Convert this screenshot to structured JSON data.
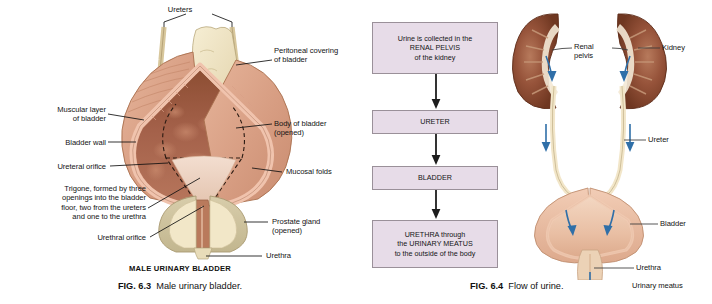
{
  "page": {
    "background": "#ffffff",
    "width": 712,
    "height": 304
  },
  "colors": {
    "flow_box_fill": "#e7dce8",
    "flow_box_border": "#9a9099",
    "arrow_blue": "#2f6fa8",
    "kidney_dark": "#7d3f28",
    "kidney_mid": "#a0583a",
    "bladder_mucosa": "#9b5a40",
    "bladder_wall_pink": "#e8b9a2",
    "peritoneum_cream": "#efe3c2",
    "prostate_tan": "#cdc19a",
    "leader_line": "#111111"
  },
  "figures": {
    "left": {
      "id": "male-urinary-bladder",
      "heading": "MALE URINARY BLADDER",
      "caption_prefix": "FIG. 6.3",
      "caption_text": "Male urinary bladder.",
      "labels": [
        {
          "key": "ureters",
          "text": "Ureters",
          "align": "center"
        },
        {
          "key": "peritoneal-covering",
          "text": "Peritoneal covering\nof bladder",
          "align": "left"
        },
        {
          "key": "muscular-layer",
          "text": "Muscular layer\nof bladder",
          "align": "right"
        },
        {
          "key": "bladder-wall",
          "text": "Bladder wall",
          "align": "right"
        },
        {
          "key": "ureteral-orifice",
          "text": "Ureteral orifice",
          "align": "right"
        },
        {
          "key": "trigone",
          "text": "Trigone, formed by three\nopenings into the bladder\nfloor, two from the ureters\nand one to the urethra",
          "align": "right"
        },
        {
          "key": "urethral-orifice",
          "text": "Urethral orifice",
          "align": "right"
        },
        {
          "key": "body-of-bladder",
          "text": "Body of bladder\n(opened)",
          "align": "left"
        },
        {
          "key": "mucosal-folds",
          "text": "Mucosal folds",
          "align": "left"
        },
        {
          "key": "prostate-gland",
          "text": "Prostate gland\n(opened)",
          "align": "left"
        },
        {
          "key": "urethra",
          "text": "Urethra",
          "align": "left"
        }
      ]
    },
    "middle": {
      "id": "flow-of-urine-flowchart",
      "steps": [
        {
          "key": "renal-pelvis",
          "text": "Urine is collected in the\nRENAL PELVIS\nof the kidney"
        },
        {
          "key": "ureter",
          "text": "URETER"
        },
        {
          "key": "bladder",
          "text": "BLADDER"
        },
        {
          "key": "urethra",
          "text": "URETHRA through\nthe URINARY MEATUS\nto the outside of the body"
        }
      ]
    },
    "right": {
      "id": "flow-of-urine-anatomy",
      "caption_prefix": "FIG. 6.4",
      "caption_text": "Flow of urine.",
      "labels": [
        {
          "key": "renal-pelvis",
          "text": "Renal\npelvis",
          "align": "left"
        },
        {
          "key": "kidney",
          "text": "Kidney",
          "align": "left"
        },
        {
          "key": "ureter",
          "text": "Ureter",
          "align": "left"
        },
        {
          "key": "bladder",
          "text": "Bladder",
          "align": "left"
        },
        {
          "key": "urethra",
          "text": "Urethra",
          "align": "left"
        },
        {
          "key": "urinary-meatus",
          "text": "Urinary meatus",
          "align": "left"
        }
      ]
    }
  }
}
